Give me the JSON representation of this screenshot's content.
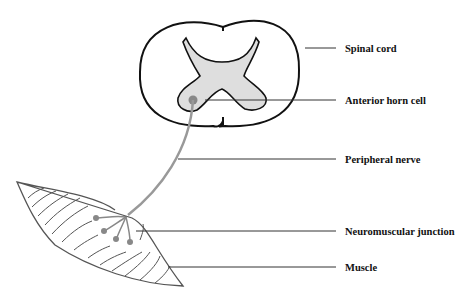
{
  "diagram": {
    "labels": [
      {
        "id": "spinal-cord",
        "text": "Spinal cord",
        "x": 345,
        "y": 50,
        "line": [
          305,
          48,
          336,
          48
        ]
      },
      {
        "id": "anterior-horn-cell",
        "text": "Anterior horn cell",
        "x": 345,
        "y": 102,
        "line": [
          205,
          100,
          336,
          100
        ]
      },
      {
        "id": "peripheral-nerve",
        "text": "Peripheral nerve",
        "x": 345,
        "y": 160,
        "line": [
          178,
          159,
          336,
          159
        ]
      },
      {
        "id": "neuromuscular-junction",
        "text": "Neuromuscular junction",
        "x": 345,
        "y": 231,
        "line": [
          136,
          231,
          336,
          231
        ]
      },
      {
        "id": "muscle",
        "text": "Muscle",
        "x": 345,
        "y": 268,
        "line": [
          168,
          267,
          336,
          267
        ]
      }
    ],
    "colors": {
      "outline": "#111111",
      "gray_matter": "#dcdcdc",
      "nerve": "#888888",
      "muscle_line": "#555555"
    }
  }
}
